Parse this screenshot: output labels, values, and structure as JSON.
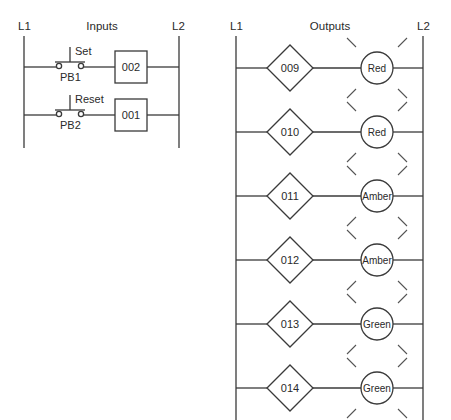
{
  "inputs_diagram": {
    "title": "Inputs",
    "left_rail": "L1",
    "right_rail": "L2",
    "rungs": [
      {
        "button_label": "Set",
        "button_id": "PB1",
        "address": "002"
      },
      {
        "button_label": "Reset",
        "button_id": "PB2",
        "address": "001"
      }
    ]
  },
  "outputs_diagram": {
    "title": "Outputs",
    "left_rail": "L1",
    "right_rail": "L2",
    "rungs": [
      {
        "address": "009",
        "lamp": "Red"
      },
      {
        "address": "010",
        "lamp": "Red"
      },
      {
        "address": "011",
        "lamp": "Amber"
      },
      {
        "address": "012",
        "lamp": "Amber"
      },
      {
        "address": "013",
        "lamp": "Green"
      },
      {
        "address": "014",
        "lamp": "Green"
      }
    ]
  }
}
